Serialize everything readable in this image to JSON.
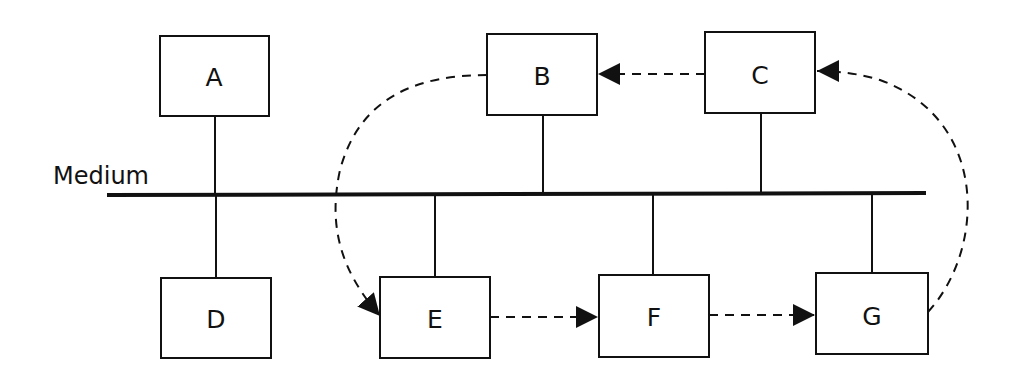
{
  "diagram": {
    "medium_label": "Medium",
    "colors": {
      "stroke": "#111111",
      "background": "#ffffff"
    },
    "nodes": {
      "A": {
        "label": "A"
      },
      "B": {
        "label": "B"
      },
      "C": {
        "label": "C"
      },
      "D": {
        "label": "D"
      },
      "E": {
        "label": "E"
      },
      "F": {
        "label": "F"
      },
      "G": {
        "label": "G"
      }
    },
    "connections": {
      "bus_attached": [
        "A",
        "B",
        "C",
        "D",
        "E",
        "F",
        "G"
      ],
      "token_flow": [
        {
          "from": "E",
          "to": "F",
          "style": "dashed-arrow"
        },
        {
          "from": "F",
          "to": "G",
          "style": "dashed-arrow"
        },
        {
          "from": "G",
          "to": "C",
          "style": "dashed-arrow"
        },
        {
          "from": "C",
          "to": "B",
          "style": "dashed-arrow"
        },
        {
          "from": "B",
          "to": "E",
          "style": "dashed-arrow"
        }
      ]
    }
  }
}
